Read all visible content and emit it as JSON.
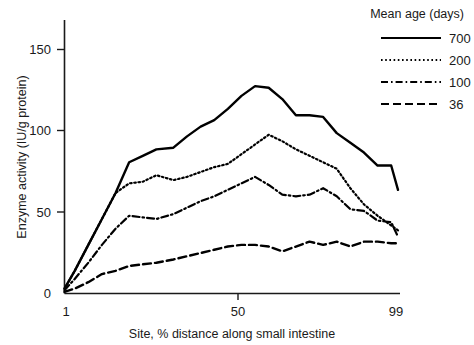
{
  "chart_data": {
    "type": "line",
    "title": "",
    "xlabel": "Site, % distance along small intestine",
    "ylabel": "Enzyme activity (IU/g protein)",
    "xlim": [
      1,
      99
    ],
    "ylim": [
      0,
      160
    ],
    "xticks": [
      1,
      50,
      99
    ],
    "xtick_labels": [
      "1",
      "50",
      "99"
    ],
    "yticks": [
      0,
      50,
      100,
      150
    ],
    "ytick_labels": [
      "0",
      "50",
      "100",
      "150"
    ],
    "grid": false,
    "legend_position": "top-right",
    "legend_title": "Mean age (days)",
    "series": [
      {
        "name": "700",
        "label": "700",
        "style": "solid",
        "color": "#000000",
        "x": [
          1,
          4,
          8,
          12,
          16,
          20,
          24,
          28,
          33,
          37,
          41,
          45,
          49,
          53,
          57,
          61,
          65,
          69,
          73,
          77,
          81,
          85,
          89,
          93,
          97,
          99
        ],
        "y": [
          3,
          14,
          30,
          46,
          62,
          81,
          85,
          89,
          90,
          97,
          103,
          107,
          114,
          122,
          128,
          127,
          120,
          110,
          110,
          109,
          99,
          93,
          87,
          79,
          79,
          64
        ]
      },
      {
        "name": "200",
        "label": "200",
        "style": "dotted",
        "color": "#000000",
        "x": [
          1,
          4,
          8,
          12,
          16,
          20,
          24,
          28,
          33,
          37,
          41,
          45,
          49,
          53,
          57,
          61,
          65,
          69,
          73,
          77,
          81,
          85,
          89,
          93,
          97,
          99
        ],
        "y": [
          3,
          14,
          30,
          46,
          62,
          68,
          69,
          73,
          70,
          72,
          75,
          78,
          80,
          86,
          92,
          98,
          94,
          89,
          85,
          81,
          77,
          65,
          55,
          48,
          42,
          39
        ]
      },
      {
        "name": "100",
        "label": "100",
        "style": "dashdot",
        "color": "#000000",
        "x": [
          1,
          4,
          8,
          12,
          16,
          20,
          24,
          28,
          33,
          37,
          41,
          45,
          49,
          53,
          57,
          61,
          65,
          69,
          73,
          77,
          81,
          85,
          89,
          93,
          97,
          99
        ],
        "y": [
          2,
          9,
          19,
          30,
          40,
          48,
          47,
          46,
          49,
          53,
          57,
          60,
          64,
          68,
          72,
          67,
          61,
          60,
          61,
          65,
          60,
          52,
          51,
          45,
          44,
          35
        ]
      },
      {
        "name": "36",
        "label": "36",
        "style": "dashed",
        "color": "#000000",
        "x": [
          1,
          4,
          8,
          12,
          16,
          20,
          24,
          28,
          33,
          37,
          41,
          45,
          49,
          53,
          57,
          61,
          65,
          69,
          73,
          77,
          81,
          85,
          89,
          93,
          97,
          99
        ],
        "y": [
          1,
          3,
          7,
          12,
          14,
          17,
          18,
          19,
          21,
          23,
          25,
          27,
          29,
          30,
          30,
          29,
          26,
          29,
          32,
          30,
          32,
          29,
          32,
          32,
          31,
          31
        ]
      }
    ]
  },
  "axes": {
    "y_title": "Enzyme activity (IU/g protein)",
    "x_title": "Site, % distance along small intestine",
    "y_ticks": [
      "150",
      "100",
      "50",
      "0"
    ],
    "x_ticks": [
      "1",
      "50",
      "99"
    ]
  },
  "legend": {
    "title": "Mean age (days)",
    "items": [
      {
        "label": "700",
        "style": "solid"
      },
      {
        "label": "200",
        "style": "dotted"
      },
      {
        "label": "100",
        "style": "dashdot"
      },
      {
        "label": "36",
        "style": "dashed"
      }
    ]
  }
}
